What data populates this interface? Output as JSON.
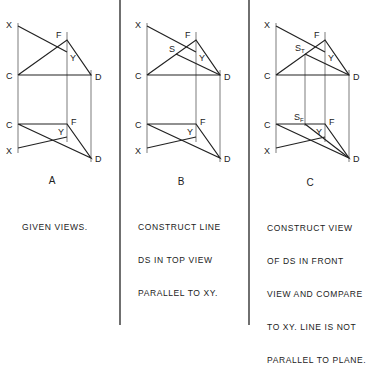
{
  "panels": [
    {
      "id": "A",
      "letter": "A",
      "caption_lines": [
        "GIVEN VIEWS."
      ],
      "top_view": {
        "points": {
          "X": "X",
          "F": "F",
          "Y": "Y",
          "C": "C",
          "D": "D"
        }
      },
      "front_view": {
        "points": {
          "C": "C",
          "F": "F",
          "Y": "Y",
          "X": "X",
          "D": "D"
        }
      }
    },
    {
      "id": "B",
      "letter": "B",
      "caption_lines": [
        "CONSTRUCT LINE",
        "DS IN TOP VIEW",
        "PARALLEL TO XY."
      ],
      "top_view": {
        "points": {
          "X": "X",
          "F": "F",
          "S": "S",
          "Y": "Y",
          "C": "C",
          "D": "D"
        }
      },
      "front_view": {
        "points": {
          "C": "C",
          "F": "F",
          "Y": "Y",
          "X": "X",
          "D": "D"
        }
      }
    },
    {
      "id": "C",
      "letter": "C",
      "caption_lines": [
        "CONSTRUCT VIEW",
        "OF DS IN FRONT",
        "VIEW AND COMPARE",
        "TO XY. LINE IS NOT",
        "PARALLEL TO PLANE."
      ],
      "top_view": {
        "points": {
          "X": "X",
          "F": "F",
          "S": "S",
          "S_sub": "T",
          "Y": "Y",
          "C": "C",
          "D": "D"
        }
      },
      "front_view": {
        "points": {
          "C": "C",
          "S": "S",
          "S_sub": "F",
          "F": "F",
          "Y": "Y",
          "X": "X",
          "D": "D"
        }
      }
    }
  ],
  "colors": {
    "line": "#222222",
    "background": "#ffffff"
  }
}
